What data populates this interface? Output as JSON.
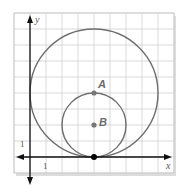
{
  "diagram": {
    "type": "coordinate-grid-circles",
    "axes": {
      "x_label": "x",
      "y_label": "y",
      "x_tick_label": "1",
      "y_tick_label": "1"
    },
    "grid": {
      "unit_px": 16,
      "origin_px": [
        30,
        157
      ],
      "x_range": [
        -1,
        9
      ],
      "y_range": [
        -1,
        9
      ]
    },
    "points": [
      {
        "label": "A",
        "x": 4,
        "y": 4
      },
      {
        "label": "B",
        "x": 4,
        "y": 2
      },
      {
        "label": "",
        "x": 4,
        "y": 0
      }
    ],
    "circles": [
      {
        "name": "small",
        "center": [
          4,
          2
        ],
        "radius": 2
      },
      {
        "name": "large",
        "center": [
          4,
          4
        ],
        "radius": 4
      }
    ],
    "colors": {
      "grid": "#cfcfcf",
      "axis": "#111111",
      "circle": "#6e6e6e",
      "point": "#777777",
      "tangent_point": "#000000",
      "shadow": "#d9d9d9"
    }
  }
}
